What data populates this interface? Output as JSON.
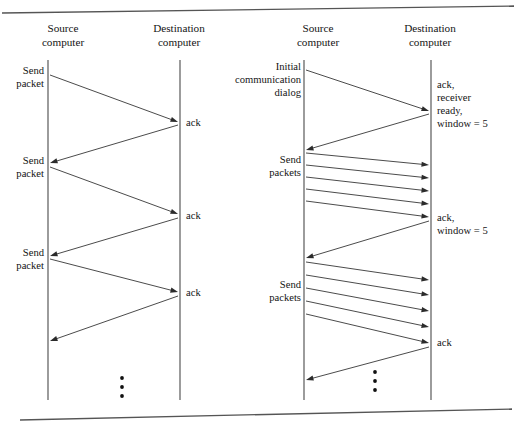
{
  "figure": {
    "top_rule": {
      "x1": 2,
      "y1": 13,
      "x2": 514,
      "y2": 6
    },
    "bottom_rule": {
      "x1": 20,
      "y1": 420,
      "x2": 512,
      "y2": 409
    },
    "colors": {
      "line": "#2b2b2b",
      "lifeline": "#4a4a4a",
      "rule": "#555555",
      "text": "#141414",
      "background": "#ffffff"
    }
  },
  "panels": [
    {
      "id": "stop-and-wait",
      "headers": [
        {
          "name": "source-header",
          "line1": "Source",
          "line2": "computer",
          "x": 63,
          "y1": 32,
          "y2": 46
        },
        {
          "name": "destination-header",
          "line1": "Destination",
          "line2": "computer",
          "x": 179,
          "y1": 32,
          "y2": 46
        }
      ],
      "lifelines": [
        {
          "name": "source-lifeline",
          "x": 48,
          "y1": 60,
          "y2": 400
        },
        {
          "name": "destination-lifeline",
          "x": 180,
          "y1": 60,
          "y2": 400
        }
      ],
      "left_labels": [
        {
          "name": "send-packet-label-1",
          "line1": "Send",
          "line2": "packet",
          "x": 44,
          "y1": 74,
          "y2": 87
        },
        {
          "name": "send-packet-label-2",
          "line1": "Send",
          "line2": "packet",
          "x": 44,
          "y1": 164,
          "y2": 177
        },
        {
          "name": "send-packet-label-3",
          "line1": "Send",
          "line2": "packet",
          "x": 44,
          "y1": 256,
          "y2": 269
        }
      ],
      "right_labels": [
        {
          "name": "ack-label-1",
          "lines": [
            "ack"
          ],
          "x": 186,
          "y": 126
        },
        {
          "name": "ack-label-2",
          "lines": [
            "ack"
          ],
          "x": 186,
          "y": 219
        },
        {
          "name": "ack-label-3",
          "lines": [
            "ack"
          ],
          "x": 186,
          "y": 296
        }
      ],
      "messages": [
        {
          "name": "packet-arrow-1",
          "dir": "right",
          "x1": 50,
          "y1": 75,
          "x2": 178,
          "y2": 122
        },
        {
          "name": "ack-arrow-1",
          "dir": "left",
          "x1": 178,
          "y1": 125,
          "x2": 50,
          "y2": 163
        },
        {
          "name": "packet-arrow-2",
          "dir": "right",
          "x1": 50,
          "y1": 167,
          "x2": 178,
          "y2": 214
        },
        {
          "name": "ack-arrow-2",
          "dir": "left",
          "x1": 178,
          "y1": 218,
          "x2": 50,
          "y2": 256
        },
        {
          "name": "packet-arrow-3",
          "dir": "right",
          "x1": 50,
          "y1": 259,
          "x2": 178,
          "y2": 292
        },
        {
          "name": "ack-arrow-3",
          "dir": "left",
          "x1": 178,
          "y1": 296,
          "x2": 50,
          "y2": 341
        }
      ],
      "ellipsis": {
        "name": "continuation-ellipsis",
        "x": 122,
        "y_start": 378,
        "spacing": 9,
        "count": 3,
        "r": 1.9
      }
    },
    {
      "id": "sliding-window",
      "headers": [
        {
          "name": "source-header",
          "line1": "Source",
          "line2": "computer",
          "x": 318,
          "y1": 32,
          "y2": 46
        },
        {
          "name": "destination-header",
          "line1": "Destination",
          "line2": "computer",
          "x": 430,
          "y1": 32,
          "y2": 46
        }
      ],
      "lifelines": [
        {
          "name": "source-lifeline",
          "x": 304,
          "y1": 60,
          "y2": 400
        },
        {
          "name": "destination-lifeline",
          "x": 431,
          "y1": 60,
          "y2": 400
        }
      ],
      "left_labels": [
        {
          "name": "initial-dialog-label",
          "line1": "Initial",
          "line2": "communication",
          "line3": "dialog",
          "x": 301,
          "y1": 70,
          "y2": 83,
          "y3": 96
        },
        {
          "name": "send-packets-label-1",
          "line1": "Send",
          "line2": "packets",
          "x": 301,
          "y1": 163,
          "y2": 176
        },
        {
          "name": "send-packets-label-2",
          "line1": "Send",
          "line2": "packets",
          "x": 301,
          "y1": 288,
          "y2": 301
        }
      ],
      "right_labels": [
        {
          "name": "ack-receiver-ready-label",
          "lines": [
            "ack,",
            "receiver",
            "ready,",
            "window = 5"
          ],
          "x": 437,
          "y": 88,
          "line_height": 13
        },
        {
          "name": "ack-window-label",
          "lines": [
            "ack,",
            "window = 5"
          ],
          "x": 437,
          "y": 221,
          "line_height": 13
        },
        {
          "name": "ack-label-final",
          "lines": [
            "ack"
          ],
          "x": 437,
          "y": 346,
          "line_height": 13
        }
      ],
      "messages": [
        {
          "name": "initial-dialog-arrow",
          "dir": "right",
          "x1": 306,
          "y1": 70,
          "x2": 429,
          "y2": 111
        },
        {
          "name": "initial-ack-arrow",
          "dir": "left",
          "x1": 429,
          "y1": 114,
          "x2": 306,
          "y2": 150
        },
        {
          "name": "packet-arrow-1",
          "dir": "right",
          "x1": 306,
          "y1": 153,
          "x2": 429,
          "y2": 165
        },
        {
          "name": "packet-arrow-2",
          "dir": "right",
          "x1": 306,
          "y1": 165,
          "x2": 429,
          "y2": 178
        },
        {
          "name": "packet-arrow-3",
          "dir": "right",
          "x1": 306,
          "y1": 177,
          "x2": 429,
          "y2": 191
        },
        {
          "name": "packet-arrow-4",
          "dir": "right",
          "x1": 306,
          "y1": 189,
          "x2": 429,
          "y2": 204
        },
        {
          "name": "packet-arrow-5",
          "dir": "right",
          "x1": 306,
          "y1": 201,
          "x2": 429,
          "y2": 217
        },
        {
          "name": "window-ack-arrow",
          "dir": "left",
          "x1": 429,
          "y1": 221,
          "x2": 306,
          "y2": 258
        },
        {
          "name": "packet-arrow-6",
          "dir": "right",
          "x1": 306,
          "y1": 262,
          "x2": 429,
          "y2": 280
        },
        {
          "name": "packet-arrow-7",
          "dir": "right",
          "x1": 306,
          "y1": 275,
          "x2": 429,
          "y2": 295
        },
        {
          "name": "packet-arrow-8",
          "dir": "right",
          "x1": 306,
          "y1": 288,
          "x2": 429,
          "y2": 311
        },
        {
          "name": "packet-arrow-9",
          "dir": "right",
          "x1": 306,
          "y1": 301,
          "x2": 429,
          "y2": 327
        },
        {
          "name": "packet-arrow-10",
          "dir": "right",
          "x1": 306,
          "y1": 314,
          "x2": 429,
          "y2": 343
        },
        {
          "name": "final-ack-arrow",
          "dir": "left",
          "x1": 429,
          "y1": 347,
          "x2": 306,
          "y2": 380
        }
      ],
      "ellipsis": {
        "name": "continuation-ellipsis",
        "x": 375,
        "y_start": 372,
        "spacing": 9,
        "count": 3,
        "r": 1.9
      }
    }
  ],
  "chart_data": {
    "type": "diagram",
    "diagram_kind": "sequence-diagram",
    "panel_count": 2,
    "panels": [
      {
        "name": "stop-and-wait",
        "actors": [
          "Source computer",
          "Destination computer"
        ],
        "exchanges": [
          {
            "step": 1,
            "from": "Source computer",
            "to": "Destination computer",
            "label": "Send packet"
          },
          {
            "step": 2,
            "from": "Destination computer",
            "to": "Source computer",
            "label": "ack"
          },
          {
            "step": 3,
            "from": "Source computer",
            "to": "Destination computer",
            "label": "Send packet"
          },
          {
            "step": 4,
            "from": "Destination computer",
            "to": "Source computer",
            "label": "ack"
          },
          {
            "step": 5,
            "from": "Source computer",
            "to": "Destination computer",
            "label": "Send packet"
          },
          {
            "step": 6,
            "from": "Destination computer",
            "to": "Source computer",
            "label": "ack"
          }
        ],
        "packets_per_burst": 1,
        "continues": true
      },
      {
        "name": "sliding-window",
        "actors": [
          "Source computer",
          "Destination computer"
        ],
        "exchanges": [
          {
            "step": 1,
            "from": "Source computer",
            "to": "Destination computer",
            "label": "Initial communication dialog"
          },
          {
            "step": 2,
            "from": "Destination computer",
            "to": "Source computer",
            "label": "ack, receiver ready, window = 5"
          },
          {
            "step": 3,
            "from": "Source computer",
            "to": "Destination computer",
            "label": "Send packets",
            "count": 5
          },
          {
            "step": 4,
            "from": "Destination computer",
            "to": "Source computer",
            "label": "ack, window = 5"
          },
          {
            "step": 5,
            "from": "Source computer",
            "to": "Destination computer",
            "label": "Send packets",
            "count": 5
          },
          {
            "step": 6,
            "from": "Destination computer",
            "to": "Source computer",
            "label": "ack"
          }
        ],
        "packets_per_burst": 5,
        "window_size": 5,
        "continues": true
      }
    ]
  }
}
